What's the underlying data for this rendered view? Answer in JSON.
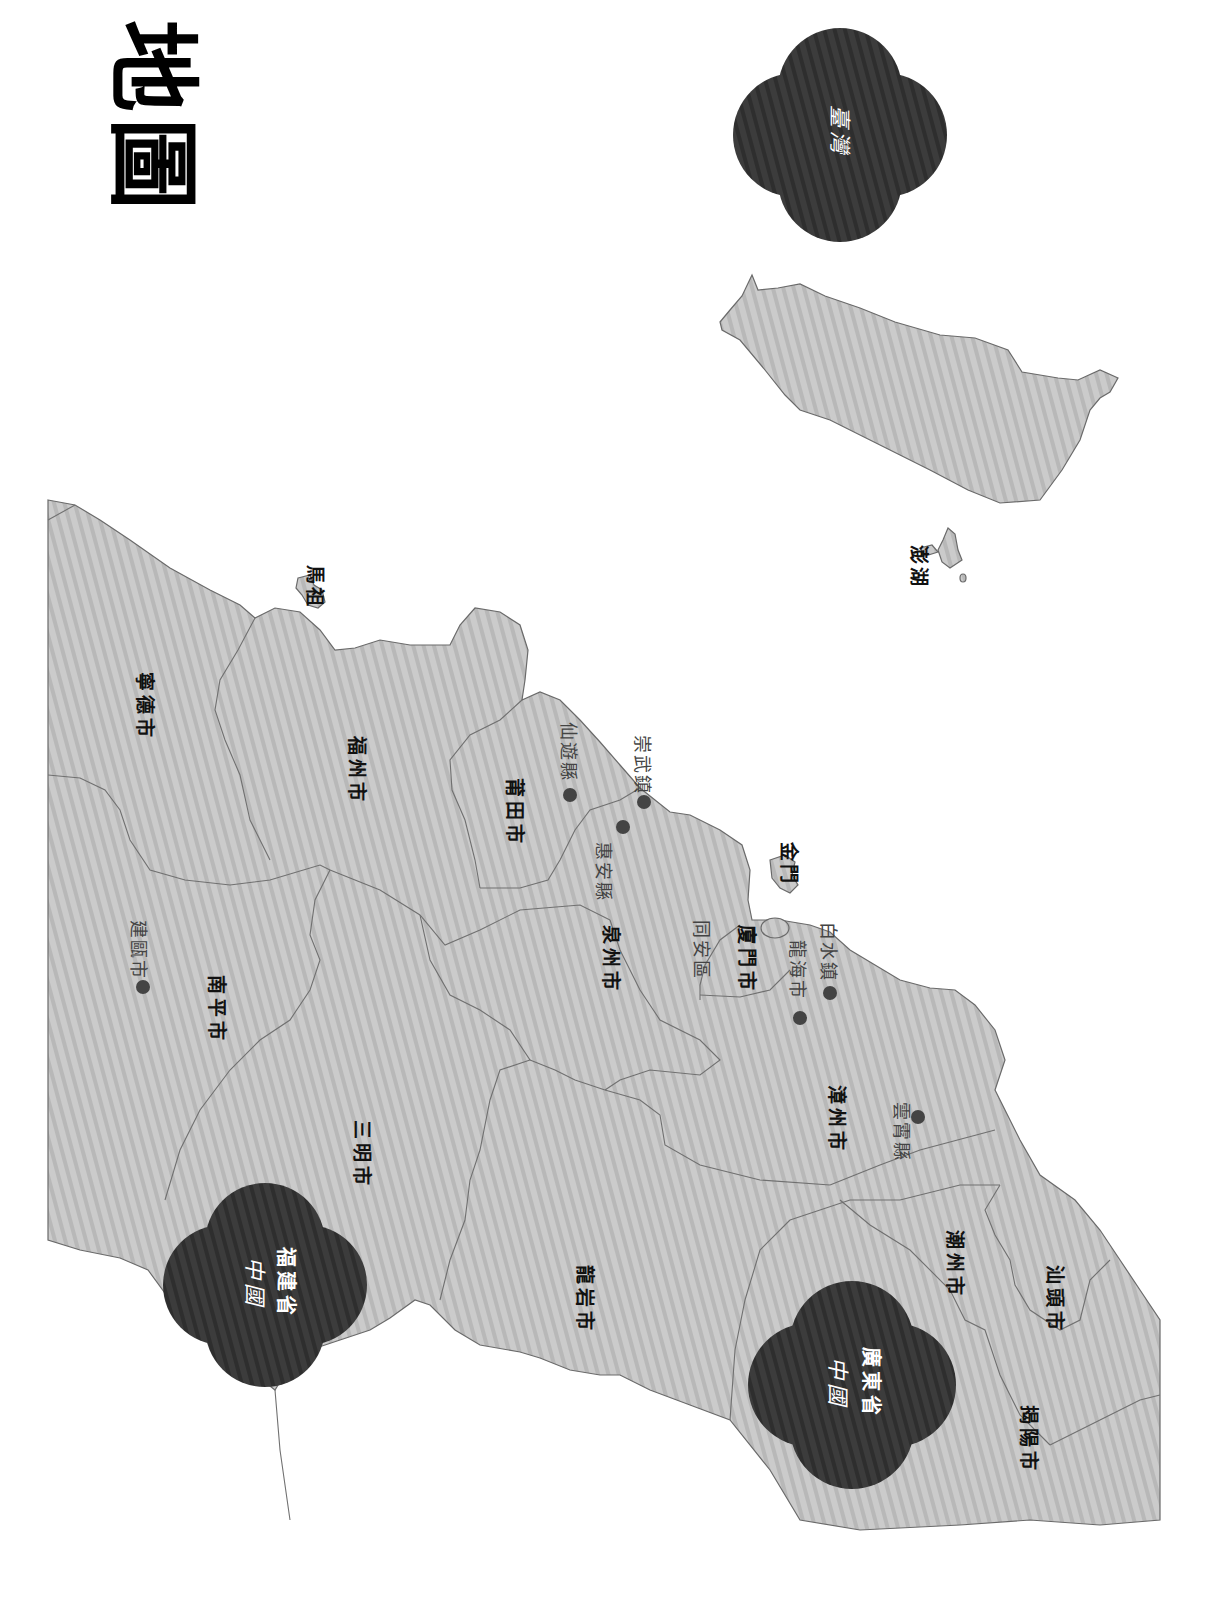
{
  "title": "地圖",
  "colors": {
    "land": "#c8c8c8",
    "land_stripe": "#b4b4b4",
    "border": "#6a6a6a",
    "badge": "#3a3a3a",
    "label": "#111111",
    "town_label": "#444444",
    "dot": "#444444",
    "background": "#ffffff"
  },
  "badges": [
    {
      "id": "taiwan",
      "script": "臺灣",
      "label": ""
    },
    {
      "id": "fujian",
      "script": "中國",
      "label": "福建省"
    },
    {
      "id": "guangdong",
      "script": "中國",
      "label": "廣東省"
    }
  ],
  "islands": [
    {
      "id": "matsu",
      "label": "馬祖"
    },
    {
      "id": "kinmen",
      "label": "金門"
    },
    {
      "id": "penghu",
      "label": "澎湖"
    }
  ],
  "cities": [
    {
      "id": "ningde",
      "label": "寧德市"
    },
    {
      "id": "fuzhou",
      "label": "福州市"
    },
    {
      "id": "putian",
      "label": "莆田市"
    },
    {
      "id": "nanping",
      "label": "南平市"
    },
    {
      "id": "quanzhou",
      "label": "泉州市"
    },
    {
      "id": "xiamen",
      "label": "廈門市"
    },
    {
      "id": "sanming",
      "label": "三明市"
    },
    {
      "id": "zhangzhou",
      "label": "漳州市"
    },
    {
      "id": "longyan",
      "label": "龍岩市"
    },
    {
      "id": "chaozhou",
      "label": "潮州市"
    },
    {
      "id": "shantou",
      "label": "汕頭市"
    },
    {
      "id": "jieyang",
      "label": "揭陽市"
    }
  ],
  "towns": [
    {
      "id": "jianou",
      "label": "建甌市"
    },
    {
      "id": "xianyou",
      "label": "仙遊縣"
    },
    {
      "id": "huian",
      "label": "惠安縣"
    },
    {
      "id": "chongwu",
      "label": "崇武鎮"
    },
    {
      "id": "tongan",
      "label": "同安區"
    },
    {
      "id": "longhai",
      "label": "龍海市"
    },
    {
      "id": "baishui",
      "label": "白水鎮"
    },
    {
      "id": "yunxiao",
      "label": "雲霄縣"
    }
  ]
}
